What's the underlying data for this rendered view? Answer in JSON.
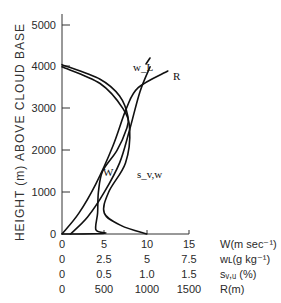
{
  "chart_data": {
    "type": "line",
    "title": "",
    "ylabel": "HEIGHT (m) ABOVE CLOUD BASE",
    "ylim": [
      0,
      5000
    ],
    "yticks": [
      "0",
      "1000",
      "2000",
      "3000",
      "4000",
      "5000"
    ],
    "x_axes": [
      {
        "label": "W(m sec⁻¹)",
        "ticks": [
          "0",
          "5",
          "10",
          "15"
        ],
        "range": [
          0,
          15
        ]
      },
      {
        "label": "wʟ(g kg⁻¹)",
        "ticks": [
          "0",
          "2.5",
          "5",
          "7.5"
        ],
        "range": [
          0,
          7.5
        ]
      },
      {
        "label": "sᵥ,ᵤ (%)",
        "ticks": [
          "0",
          "0.5",
          "1.0",
          "1.5"
        ],
        "range": [
          0,
          1.5
        ]
      },
      {
        "label": "R(m)",
        "ticks": [
          "0",
          "500",
          "1000",
          "1500"
        ],
        "range": [
          0,
          1500
        ]
      }
    ],
    "series": [
      {
        "name": "W",
        "unit": "m sec-1",
        "points": [
          [
            0,
            0
          ],
          [
            5,
            20
          ],
          [
            4,
            100
          ],
          [
            4.2,
            500
          ],
          [
            4.3,
            1000
          ],
          [
            4.8,
            1500
          ],
          [
            6.5,
            2000
          ],
          [
            7.6,
            2500
          ],
          [
            7.8,
            2800
          ],
          [
            6.8,
            3300
          ],
          [
            4.5,
            3700
          ],
          [
            0,
            4050
          ]
        ]
      },
      {
        "name": "s_v,w",
        "unit": "%",
        "points": [
          [
            1.0,
            0
          ],
          [
            0.7,
            200
          ],
          [
            0.5,
            500
          ],
          [
            0.55,
            1000
          ],
          [
            0.75,
            1700
          ],
          [
            0.8,
            2500
          ],
          [
            0.72,
            3000
          ],
          [
            0.45,
            3600
          ],
          [
            0,
            4000
          ]
        ]
      },
      {
        "name": "w_L",
        "unit": "g kg-1",
        "points": [
          [
            0.5,
            0
          ],
          [
            1.5,
            400
          ],
          [
            2.5,
            1000
          ],
          [
            3.4,
            1700
          ],
          [
            4.0,
            2500
          ],
          [
            4.6,
            3400
          ],
          [
            5.2,
            4000
          ]
        ]
      },
      {
        "name": "R",
        "unit": "m",
        "points": [
          [
            0,
            0
          ],
          [
            200,
            500
          ],
          [
            400,
            1200
          ],
          [
            600,
            2100
          ],
          [
            760,
            3000
          ],
          [
            900,
            3500
          ],
          [
            1250,
            3900
          ]
        ]
      }
    ],
    "annotations": [
      "W",
      "s_v,w",
      "w_L",
      "R"
    ],
    "grid": false,
    "legend_position": "inline labels"
  }
}
